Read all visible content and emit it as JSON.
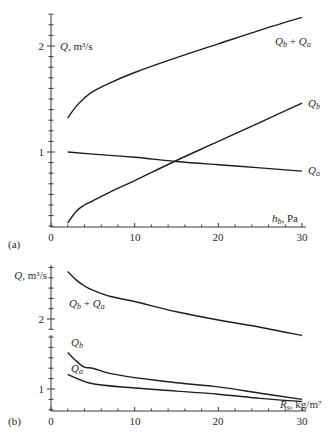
{
  "chart_data": [
    {
      "panel": "(a)",
      "type": "line",
      "title": "",
      "xlabel": "h_b, Pa",
      "ylabel": "Q, m³/s",
      "xlim": [
        0,
        30
      ],
      "ylim": [
        0.3,
        2.3
      ],
      "x_ticks": [
        0,
        10,
        20,
        30
      ],
      "y_ticks_labeled": [
        1,
        2
      ],
      "grid": false,
      "series": [
        {
          "name": "Q_b + Q_a",
          "x": [
            2,
            3,
            4,
            5,
            7,
            10,
            15,
            20,
            25,
            30
          ],
          "values": [
            1.32,
            1.43,
            1.51,
            1.57,
            1.65,
            1.75,
            1.89,
            2.02,
            2.15,
            2.27
          ]
        },
        {
          "name": "Q_b",
          "x": [
            2,
            3,
            4,
            5,
            7,
            10,
            15,
            20,
            25,
            30
          ],
          "values": [
            0.33,
            0.44,
            0.5,
            0.54,
            0.62,
            0.73,
            0.92,
            1.1,
            1.28,
            1.46
          ]
        },
        {
          "name": "Q_a",
          "x": [
            2,
            5,
            10,
            15,
            20,
            25,
            30
          ],
          "values": [
            1.0,
            0.98,
            0.95,
            0.91,
            0.88,
            0.85,
            0.82
          ]
        }
      ]
    },
    {
      "panel": "(b)",
      "type": "line",
      "title": "",
      "xlabel": "R_s, kg/m⁷",
      "ylabel": "Q, m³/s",
      "xlim": [
        0,
        30
      ],
      "ylim_lower": [
        0.79,
        1.5
      ],
      "ylim_upper": [
        1.95,
        2.5
      ],
      "axis_break": true,
      "x_ticks": [
        0,
        10,
        20,
        30
      ],
      "y_ticks_labeled": [
        1,
        2
      ],
      "grid": false,
      "series": [
        {
          "name": "Q_b + Q_a",
          "x": [
            2,
            3,
            4,
            5,
            7,
            10,
            15,
            20,
            25,
            30
          ],
          "values": [
            2.46,
            2.38,
            2.32,
            2.28,
            2.22,
            2.17,
            2.07,
            1.99,
            1.92,
            1.84
          ]
        },
        {
          "name": "Q_b",
          "x": [
            2,
            3,
            4,
            5,
            7,
            10,
            15,
            20,
            25,
            30
          ],
          "values": [
            1.35,
            1.27,
            1.21,
            1.2,
            1.15,
            1.11,
            1.06,
            1.02,
            0.96,
            0.9
          ]
        },
        {
          "name": "Q_a",
          "x": [
            2,
            5,
            10,
            15,
            20,
            25,
            30
          ],
          "values": [
            1.14,
            1.05,
            1.01,
            0.98,
            0.95,
            0.91,
            0.88
          ]
        }
      ]
    }
  ],
  "labels": {
    "a": {
      "ylabel": "Q, m³/s",
      "xlabel_main": "h",
      "xlabel_sub": "b",
      "xlabel_unit": ", Pa",
      "ytick_2": "2",
      "ytick_1": "1",
      "xtick_0": "0",
      "xtick_10": "10",
      "xtick_20": "20",
      "xtick_30": "30",
      "panel": "(a)",
      "curve_sum": "Q",
      "curve_sum_sub1": "b",
      "curve_sum_plus": " + Q",
      "curve_sum_sub2": "a",
      "curve_b": "Q",
      "curve_b_sub": "b",
      "curve_a": "Q",
      "curve_a_sub": "a"
    },
    "b": {
      "ylabel": "Q, m³/s",
      "xlabel_main": "R",
      "xlabel_sub": "s",
      "xlabel_unit": ", kg/m⁷",
      "ytick_2": "2",
      "ytick_1": "1",
      "xtick_0": "0",
      "xtick_10": "10",
      "xtick_20": "20",
      "xtick_30": "30",
      "panel": "(b)",
      "curve_sum": "Q",
      "curve_sum_sub1": "b",
      "curve_sum_plus": " + Q",
      "curve_sum_sub2": "a",
      "curve_b": "Q",
      "curve_b_sub": "b",
      "curve_a": "Q",
      "curve_a_sub": "a"
    }
  }
}
